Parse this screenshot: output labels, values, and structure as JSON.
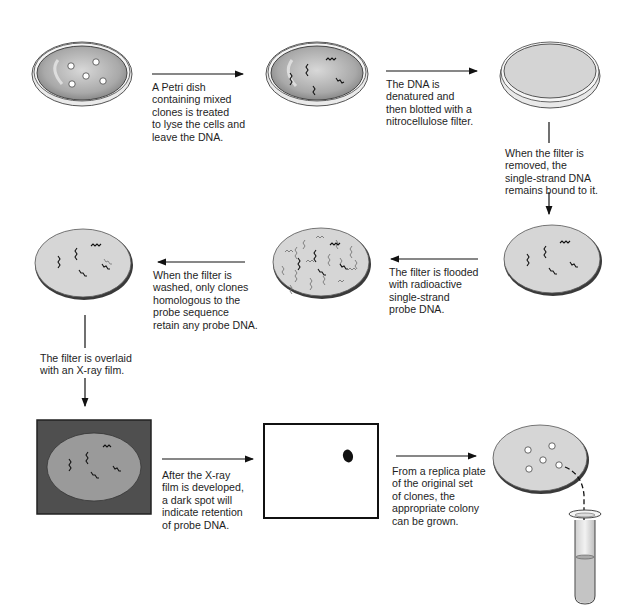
{
  "diagram": {
    "steps": [
      {
        "id": 1,
        "label": "Petri dish with mixed clones",
        "caption": "A Petri dish\ncontaining mixed\nclones is treated\nto lyse the cells and\nleave the DNA."
      },
      {
        "id": 2,
        "label": "Lysed colonies with DNA",
        "caption": "The DNA is\ndenatured and\nthen blotted with a\nnitrocellulose filter."
      },
      {
        "id": 3,
        "label": "Nitrocellulose filter on dish",
        "caption": "When the filter is\nremoved, the\nsingle-strand DNA\nremains bound to it."
      },
      {
        "id": 4,
        "label": "Filter with bound single-strand DNA",
        "caption": "The filter is flooded\nwith radioactive\nsingle-strand\nprobe DNA."
      },
      {
        "id": 5,
        "label": "Filter flooded with probe DNA",
        "caption": "When the filter is\nwashed, only clones\nhomologous to the\nprobe sequence\nretain any probe DNA."
      },
      {
        "id": 6,
        "label": "Washed filter",
        "caption": "The filter is overlaid\nwith an X-ray film."
      },
      {
        "id": 7,
        "label": "Filter overlaid with X-ray film",
        "caption": "After the X-ray\nfilm is developed,\na dark spot will\nindicate retention\nof probe DNA."
      },
      {
        "id": 8,
        "label": "Developed X-ray film with dark spot",
        "caption": "From a replica plate\nof the original set\nof clones, the\nappropriate colony\ncan be grown."
      },
      {
        "id": 9,
        "label": "Replica plate and culture tube",
        "caption": ""
      }
    ],
    "colors": {
      "filter_fill": "#d6d6d6",
      "filter_edge": "#3a3a3a",
      "film_dark": "#4a4a4a",
      "dish_fill": "#b9b9b9",
      "line": "#111111"
    }
  }
}
